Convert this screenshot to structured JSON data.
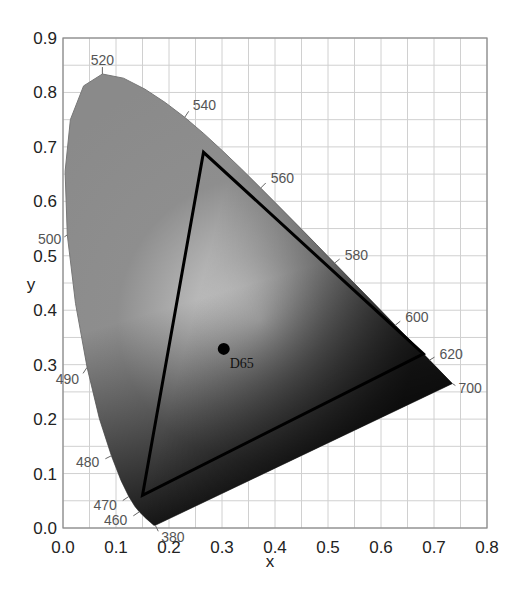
{
  "chart_data": {
    "type": "scatter",
    "title": "",
    "xlabel": "x",
    "ylabel": "y",
    "xlim": [
      0.0,
      0.8
    ],
    "ylim": [
      0.0,
      0.9
    ],
    "grid": true,
    "grid_step": 0.05,
    "x_ticks": [
      "0.0",
      "0.1",
      "0.2",
      "0.3",
      "0.4",
      "0.5",
      "0.6",
      "0.7",
      "0.8"
    ],
    "y_ticks": [
      "0.0",
      "0.1",
      "0.2",
      "0.3",
      "0.4",
      "0.5",
      "0.6",
      "0.7",
      "0.8",
      "0.9"
    ],
    "spectral_locus": {
      "name": "CIE 1931 spectral locus",
      "points": [
        {
          "nm": 380,
          "x": 0.1741,
          "y": 0.005
        },
        {
          "nm": 420,
          "x": 0.1714,
          "y": 0.0051
        },
        {
          "nm": 440,
          "x": 0.1644,
          "y": 0.0109
        },
        {
          "nm": 450,
          "x": 0.1566,
          "y": 0.0177
        },
        {
          "nm": 460,
          "x": 0.144,
          "y": 0.0297
        },
        {
          "nm": 465,
          "x": 0.1355,
          "y": 0.0399
        },
        {
          "nm": 470,
          "x": 0.1241,
          "y": 0.0578
        },
        {
          "nm": 475,
          "x": 0.1096,
          "y": 0.0868
        },
        {
          "nm": 480,
          "x": 0.0913,
          "y": 0.1327
        },
        {
          "nm": 485,
          "x": 0.0687,
          "y": 0.2007
        },
        {
          "nm": 490,
          "x": 0.0454,
          "y": 0.295
        },
        {
          "nm": 495,
          "x": 0.0235,
          "y": 0.4127
        },
        {
          "nm": 500,
          "x": 0.0082,
          "y": 0.5384
        },
        {
          "nm": 505,
          "x": 0.0039,
          "y": 0.6548
        },
        {
          "nm": 510,
          "x": 0.0139,
          "y": 0.7502
        },
        {
          "nm": 515,
          "x": 0.0389,
          "y": 0.812
        },
        {
          "nm": 520,
          "x": 0.0743,
          "y": 0.8338
        },
        {
          "nm": 525,
          "x": 0.1142,
          "y": 0.8262
        },
        {
          "nm": 530,
          "x": 0.1547,
          "y": 0.8059
        },
        {
          "nm": 535,
          "x": 0.1929,
          "y": 0.7816
        },
        {
          "nm": 540,
          "x": 0.2296,
          "y": 0.7543
        },
        {
          "nm": 545,
          "x": 0.2658,
          "y": 0.7243
        },
        {
          "nm": 550,
          "x": 0.3016,
          "y": 0.6923
        },
        {
          "nm": 555,
          "x": 0.3373,
          "y": 0.6589
        },
        {
          "nm": 560,
          "x": 0.3731,
          "y": 0.6245
        },
        {
          "nm": 565,
          "x": 0.4087,
          "y": 0.5896
        },
        {
          "nm": 570,
          "x": 0.4441,
          "y": 0.5547
        },
        {
          "nm": 575,
          "x": 0.4788,
          "y": 0.5202
        },
        {
          "nm": 580,
          "x": 0.5125,
          "y": 0.4866
        },
        {
          "nm": 585,
          "x": 0.5448,
          "y": 0.4544
        },
        {
          "nm": 590,
          "x": 0.5752,
          "y": 0.4242
        },
        {
          "nm": 595,
          "x": 0.6029,
          "y": 0.3965
        },
        {
          "nm": 600,
          "x": 0.627,
          "y": 0.3725
        },
        {
          "nm": 610,
          "x": 0.6658,
          "y": 0.334
        },
        {
          "nm": 620,
          "x": 0.6915,
          "y": 0.3083
        },
        {
          "nm": 640,
          "x": 0.719,
          "y": 0.2809
        },
        {
          "nm": 660,
          "x": 0.73,
          "y": 0.27
        },
        {
          "nm": 700,
          "x": 0.7347,
          "y": 0.2653
        }
      ]
    },
    "wavelength_labels": [
      "520",
      "540",
      "560",
      "580",
      "600",
      "620",
      "700",
      "500",
      "490",
      "480",
      "470",
      "460",
      "380"
    ],
    "gamut_triangle": {
      "name": "Color gamut",
      "vertices": [
        {
          "label": "R",
          "x": 0.68,
          "y": 0.32
        },
        {
          "label": "G",
          "x": 0.265,
          "y": 0.69
        },
        {
          "label": "B",
          "x": 0.15,
          "y": 0.06
        }
      ]
    },
    "white_point": {
      "label": "D65",
      "x": 0.3127,
      "y": 0.329
    }
  },
  "labels": {
    "x_axis": "x",
    "y_axis": "y",
    "white_point": "D65"
  }
}
